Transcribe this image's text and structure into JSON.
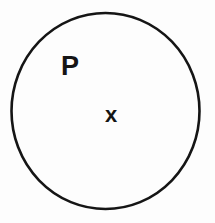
{
  "figure": {
    "kind": "set-diagram",
    "background_color": "#fdfdfd",
    "ink_color": "#151515"
  },
  "set_region": {
    "name": "set-circle",
    "shape": "circle",
    "label": "P",
    "stroke_color": "#151515",
    "stroke_width": 2.6,
    "fill": "none",
    "center_x": 105.5,
    "center_y": 111,
    "radius_x": 94,
    "radius_y": 98
  },
  "set_label": {
    "text": "P",
    "x": 69,
    "y": 67
  },
  "element": {
    "name": "element-x",
    "text": "x",
    "x": 112,
    "y": 115
  },
  "chart_data": {
    "type": "diagram",
    "title": "",
    "shapes": [
      {
        "type": "circle",
        "label": "P",
        "cx": 105.5,
        "cy": 111,
        "rx": 94,
        "ry": 98,
        "stroke": "#151515",
        "fill": "none"
      }
    ],
    "points": [
      {
        "label": "x",
        "x": 112,
        "y": 115,
        "inside": "P"
      }
    ],
    "labels": [
      "P",
      "x"
    ]
  }
}
